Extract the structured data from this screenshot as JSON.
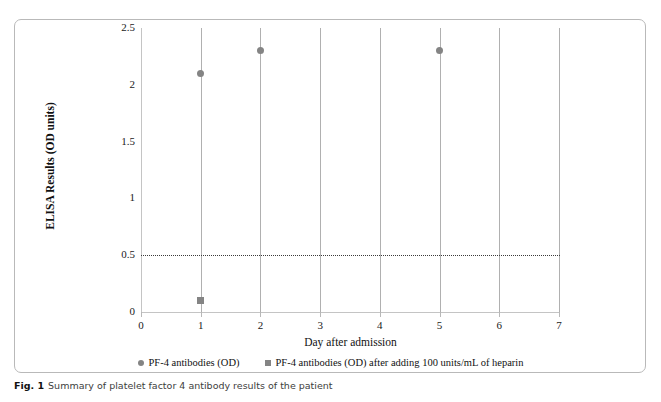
{
  "figure": {
    "caption_label": "Fig. 1",
    "caption_text": "Summary of platelet factor 4 antibody results of the patient"
  },
  "chart_data": {
    "type": "scatter",
    "title": "",
    "xlabel": "Day after admission",
    "ylabel": "ELISA Results (OD units)",
    "xlim": [
      0,
      7
    ],
    "ylim": [
      0,
      2.5
    ],
    "xticks": [
      "0",
      "1",
      "2",
      "3",
      "4",
      "5",
      "6",
      "7"
    ],
    "yticks": [
      "0",
      "0.5",
      "1",
      "1.5",
      "2",
      "2.5"
    ],
    "ytick_values": [
      0,
      0.5,
      1,
      1.5,
      2,
      2.5
    ],
    "xtick_values": [
      0,
      1,
      2,
      3,
      4,
      5,
      6,
      7
    ],
    "grid": "vertical category lines at days 1-7",
    "legend_position": "bottom-center",
    "series": [
      {
        "name": "PF-4 antibodies (OD)",
        "marker": "circle",
        "color": "#848484",
        "points": [
          {
            "x": 1,
            "y": 2.1
          },
          {
            "x": 2,
            "y": 2.3
          },
          {
            "x": 5,
            "y": 2.3
          }
        ]
      },
      {
        "name": "PF-4 antibodies (OD) after adding 100 units/mL of heparin",
        "marker": "square",
        "color": "#848484",
        "points": [
          {
            "x": 1,
            "y": 0.1
          }
        ]
      }
    ],
    "annotations": [
      {
        "type": "hline",
        "name": "positive-cutoff-threshold",
        "y": 0.5,
        "style": "dotted",
        "color": "#3a3a3a"
      }
    ]
  }
}
